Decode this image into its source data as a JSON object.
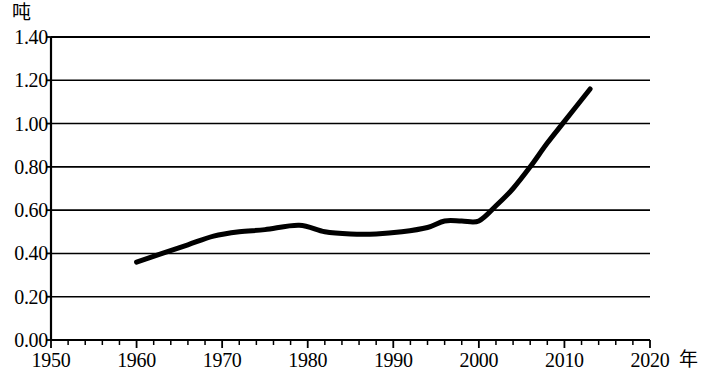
{
  "chart_data": {
    "type": "line",
    "title": "",
    "xlabel": "年",
    "ylabel": "吨",
    "xlim": [
      1950,
      2020
    ],
    "ylim": [
      0.0,
      1.4
    ],
    "grid": true,
    "legend": null,
    "x_tick_labels": [
      "1950",
      "1960",
      "1970",
      "1980",
      "1990",
      "2000",
      "2010",
      "2020"
    ],
    "x_tick_values": [
      1950,
      1960,
      1970,
      1980,
      1990,
      2000,
      2010,
      2020
    ],
    "x_minor_tick_step": 2,
    "y_tick_labels": [
      "0.00",
      "0.20",
      "0.40",
      "0.60",
      "0.80",
      "1.00",
      "1.20",
      "1.40"
    ],
    "y_tick_values": [
      0.0,
      0.2,
      0.4,
      0.6,
      0.8,
      1.0,
      1.2,
      1.4
    ],
    "series": [
      {
        "name": "",
        "color": "#000000",
        "line_width": 5,
        "x": [
          1960,
          1963,
          1966,
          1969,
          1972,
          1975,
          1979,
          1982,
          1985,
          1988,
          1991,
          1994,
          1996,
          1998,
          2000,
          2002,
          2004,
          2006,
          2008,
          2010,
          2013
        ],
        "values": [
          0.36,
          0.4,
          0.44,
          0.48,
          0.5,
          0.51,
          0.53,
          0.5,
          0.49,
          0.49,
          0.5,
          0.52,
          0.55,
          0.55,
          0.55,
          0.62,
          0.7,
          0.8,
          0.91,
          1.01,
          1.16
        ]
      }
    ]
  }
}
